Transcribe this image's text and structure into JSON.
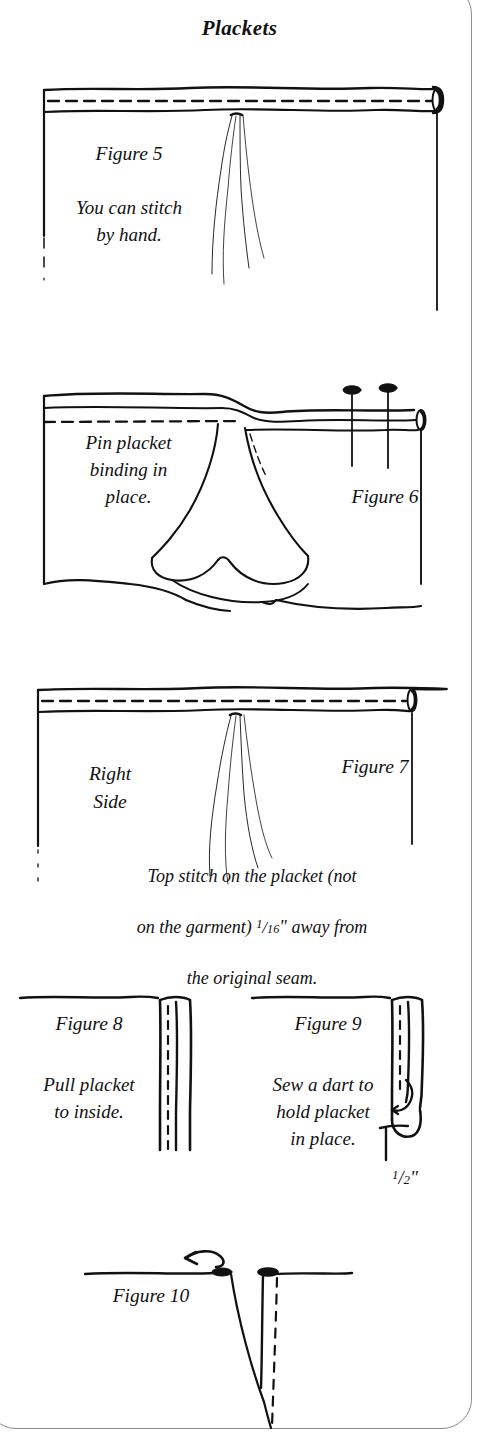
{
  "page": {
    "title": "Plackets",
    "border_color": "#8d8d8d",
    "ink_color": "#111111",
    "background": "#ffffff",
    "width": 479,
    "height": 1440
  },
  "figures": [
    {
      "id": "figure-5",
      "label": "Figure 5",
      "caption": "You can stitch\nby hand.",
      "description": "Fabric panel with placket binding band across the top, dashed stitch line through the band, rolled end at right, needle and thread strands hanging below the band."
    },
    {
      "id": "figure-6",
      "label": "Figure 6",
      "caption": "Pin placket\nbinding in\nplace.",
      "description": "Fabric panel with placket binding folded open, dashed stitch line at upper left, two straight pins with oval heads inserted through the band at right.",
      "pin_count": 2
    },
    {
      "id": "figure-7",
      "label": "Figure 7",
      "caption_left": "Right\nSide",
      "caption_bottom_lines": [
        "Top stitch on the placket (not",
        "on the garment) 1/16\" away from",
        "the original seam."
      ],
      "measurement": {
        "numerator": "1",
        "denominator": "16",
        "unit": "\""
      },
      "description": "Right side of fabric with top-stitched placket band, dashed stitch line and thread strands."
    },
    {
      "id": "figure-8",
      "label": "Figure 8",
      "caption": "Pull placket\nto inside.",
      "description": "Edge of garment with narrow placket strip turned to the inside, dashed stitch line running the length of the strip."
    },
    {
      "id": "figure-9",
      "label": "Figure 9",
      "caption": "Sew a dart to\nhold placket\nin place.",
      "measurement": {
        "numerator": "1",
        "denominator": "2",
        "unit": "\""
      },
      "description": "Placket strip with a rounded stitched end and a hooked dart at the bottom; the dart depth is labelled."
    },
    {
      "id": "figure-10",
      "label": "Figure 10",
      "description": "Cross-section of the finished dart with a curved left-pointing arrow showing the fold direction, a solid dart leg and a dashed fold line."
    }
  ]
}
